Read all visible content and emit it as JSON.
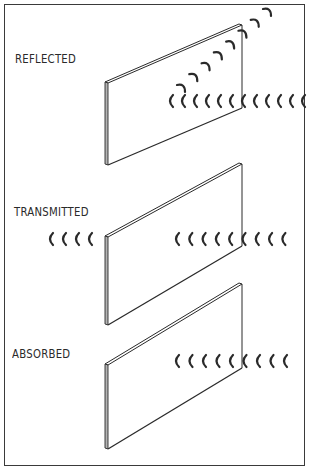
{
  "figure": {
    "labels": {
      "reflected": "REFLECTED",
      "transmitted": "TRANSMITTED",
      "absorbed": "ABSORBED"
    },
    "colors": {
      "ink": "#2a2a2a",
      "background": "#ffffff",
      "frame": "#3a3a3a"
    }
  },
  "panels": [
    {
      "name": "reflected",
      "tl": [
        105,
        82
      ],
      "tr": [
        242,
        25
      ],
      "br": [
        242,
        108
      ],
      "bl": [
        105,
        165
      ]
    },
    {
      "name": "transmitted",
      "tl": [
        105,
        236
      ],
      "tr": [
        242,
        164
      ],
      "br": [
        242,
        246
      ],
      "bl": [
        105,
        325
      ]
    },
    {
      "name": "absorbed",
      "tl": [
        105,
        364
      ],
      "tr": [
        242,
        284
      ],
      "br": [
        242,
        368
      ],
      "bl": [
        105,
        449
      ]
    }
  ],
  "waves": {
    "reflected_incoming": {
      "y": 101,
      "x_start": 170,
      "count": 12,
      "spacing": 12,
      "direction": "left"
    },
    "reflected_outgoing": {
      "start": [
        182,
        88
      ],
      "end": [
        268,
        12
      ],
      "count": 8,
      "direction": "up-right"
    },
    "transmitted_beyond": {
      "y": 239,
      "x_start": 50,
      "count": 4,
      "spacing": 13,
      "direction": "left"
    },
    "transmitted_incoming": {
      "y": 239,
      "x_start": 176,
      "count": 9,
      "spacing": 13.3,
      "direction": "left"
    },
    "absorbed_incoming": {
      "y": 361,
      "x_start": 176,
      "count": 9,
      "spacing": 13.5,
      "direction": "left"
    }
  }
}
